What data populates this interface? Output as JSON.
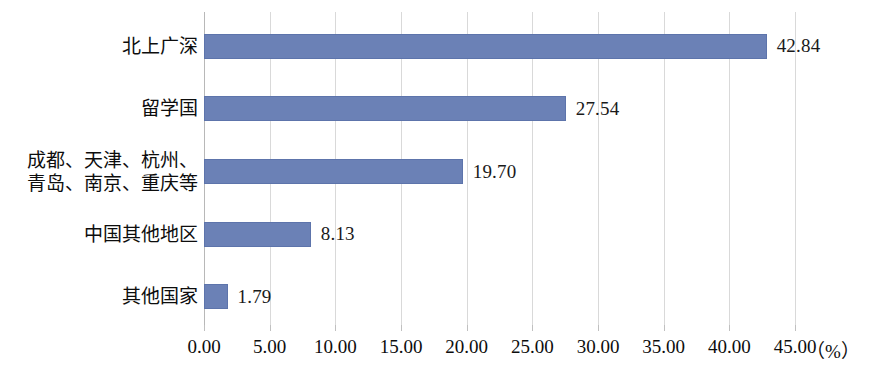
{
  "chart_data": {
    "type": "bar",
    "orientation": "horizontal",
    "title": "",
    "subtitle": "",
    "xlabel": "（%）",
    "ylabel": "",
    "categories": [
      "北上广深",
      "留学国",
      "成都、天津、杭州、\n青岛、南京、重庆等",
      "中国其他地区",
      "其他国家"
    ],
    "values": [
      42.84,
      27.54,
      19.7,
      8.13,
      1.79
    ],
    "value_labels": [
      "42.84",
      "27.54",
      "19.70",
      "8.13",
      "1.79"
    ],
    "xlim": [
      0,
      45
    ],
    "xticks": [
      0,
      5,
      10,
      15,
      20,
      25,
      30,
      35,
      40,
      45
    ],
    "xtick_labels": [
      "0.00",
      "5.00",
      "10.00",
      "15.00",
      "20.00",
      "25.00",
      "30.00",
      "35.00",
      "40.00",
      "45.00"
    ],
    "grid": true,
    "grid_axis": "x",
    "legend": false,
    "legend_position": "none",
    "bar_color": "#6B81B6",
    "grid_color": "#D9D9D9",
    "axis_color": "#B8B8B8",
    "text_color": "#0D0D0D",
    "background_color": "#FFFFFF"
  }
}
